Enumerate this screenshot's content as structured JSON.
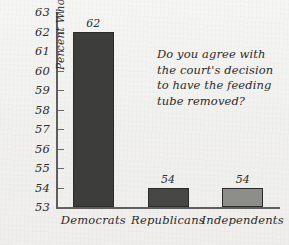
{
  "chart_data": {
    "type": "bar",
    "title": "",
    "xlabel": "",
    "ylabel": "Percent Who Agree",
    "categories": [
      "Democrats",
      "Republicans",
      "Independents"
    ],
    "values": [
      62,
      54,
      54
    ],
    "value_labels": [
      "62",
      "54",
      "54"
    ],
    "ylim": [
      53,
      63
    ],
    "yticks": [
      53,
      54,
      55,
      56,
      57,
      58,
      59,
      60,
      61,
      62,
      63
    ],
    "ytick_labels": [
      "53",
      "54",
      "55",
      "56",
      "57",
      "58",
      "59",
      "60",
      "61",
      "62",
      "63"
    ],
    "grid": false,
    "legend": "none",
    "bar_colors": [
      "#3d3d3b",
      "#474745",
      "#8d8d8a"
    ],
    "annotation": {
      "lines": [
        "Do you agree with",
        "the court's decision",
        "to have the feeding",
        "tube removed?"
      ]
    }
  },
  "style": {
    "background": "#f3f3f2",
    "axis_color": "#5e5e5c",
    "text_color": "#2b2b2a",
    "bar_border": "#2b2b2a"
  }
}
